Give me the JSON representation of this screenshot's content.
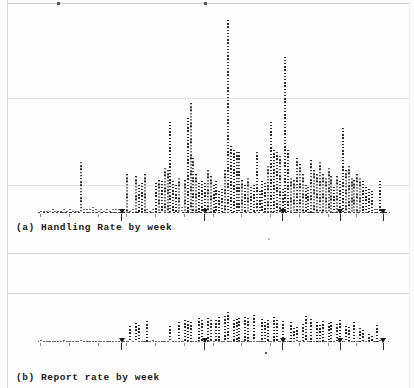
{
  "page": {
    "background_color": "#fdfdfd",
    "ink_color": "#2b2b2b",
    "rule_color": "#d5d5d5",
    "width": 414,
    "height": 388
  },
  "figures": [
    {
      "id": "figure-a",
      "caption": "(a) Handling Rate by week",
      "chart_data": {
        "type": "bar",
        "title": "(a) Handling Rate by week",
        "xlabel": "week",
        "ylabel": "Handling Rate",
        "grid": true,
        "legend": "none",
        "ylim": [
          0,
          100
        ],
        "axis_ticks_x": [
          28,
          57,
          84,
          104,
          119
        ],
        "categories": [
          "w1",
          "w2",
          "w3",
          "w4",
          "w5",
          "w6",
          "w7",
          "w8",
          "w9",
          "w10",
          "w11",
          "w12",
          "w13",
          "w14",
          "w15",
          "w16",
          "w17",
          "w18",
          "w19",
          "w20",
          "w21",
          "w22",
          "w23",
          "w24",
          "w25",
          "w26",
          "w27",
          "w28",
          "w29",
          "w30",
          "w31",
          "w32",
          "w33",
          "w34",
          "w35",
          "w36",
          "w37",
          "w38",
          "w39",
          "w40",
          "w41",
          "w42",
          "w43",
          "w44",
          "w45",
          "w46",
          "w47",
          "w48",
          "w49",
          "w50",
          "w51",
          "w52",
          "w53",
          "w54",
          "w55",
          "w56",
          "w57",
          "w58",
          "w59",
          "w60",
          "w61",
          "w62",
          "w63",
          "w64",
          "w65",
          "w66",
          "w67",
          "w68",
          "w69",
          "w70",
          "w71",
          "w72",
          "w73",
          "w74",
          "w75",
          "w76",
          "w77",
          "w78",
          "w79",
          "w80",
          "w81",
          "w82",
          "w83",
          "w84",
          "w85",
          "w86",
          "w87",
          "w88",
          "w89",
          "w90",
          "w91",
          "w92",
          "w93",
          "w94",
          "w95",
          "w96",
          "w97",
          "w98",
          "w99",
          "w100",
          "w101",
          "w102",
          "w103",
          "w104",
          "w105",
          "w106",
          "w107",
          "w108",
          "w109",
          "w110",
          "w111",
          "w112",
          "w113",
          "w114",
          "w115",
          "w116",
          "w117",
          "w118",
          "w119",
          "w120"
        ],
        "values": [
          1,
          1,
          1,
          1,
          2,
          1,
          1,
          1,
          2,
          1,
          2,
          1,
          1,
          1,
          26,
          2,
          2,
          2,
          3,
          2,
          1,
          2,
          1,
          2,
          1,
          2,
          2,
          2,
          1,
          2,
          20,
          1,
          2,
          19,
          14,
          15,
          20,
          2,
          1,
          2,
          15,
          17,
          16,
          23,
          22,
          46,
          16,
          14,
          18,
          3,
          17,
          48,
          56,
          28,
          20,
          15,
          16,
          15,
          22,
          19,
          14,
          16,
          11,
          12,
          22,
          98,
          34,
          32,
          31,
          31,
          17,
          14,
          18,
          13,
          14,
          31,
          11,
          16,
          15,
          24,
          46,
          32,
          31,
          29,
          12,
          79,
          32,
          18,
          17,
          28,
          25,
          20,
          14,
          13,
          27,
          22,
          20,
          26,
          20,
          18,
          23,
          19,
          13,
          19,
          16,
          43,
          22,
          24,
          18,
          17,
          20,
          18,
          16,
          13,
          12,
          11,
          2,
          2,
          16,
          2
        ]
      }
    },
    {
      "id": "figure-b",
      "caption": "(b) Report rate by week",
      "chart_data": {
        "type": "bar",
        "title": "(b) Report rate by week",
        "xlabel": "week",
        "ylabel": "Report rate",
        "grid": true,
        "legend": "none",
        "ylim": [
          0,
          40
        ],
        "axis_ticks_x": [
          28,
          57,
          84,
          104,
          119
        ],
        "categories": [
          "w1",
          "w2",
          "w3",
          "w4",
          "w5",
          "w6",
          "w7",
          "w8",
          "w9",
          "w10",
          "w11",
          "w12",
          "w13",
          "w14",
          "w15",
          "w16",
          "w17",
          "w18",
          "w19",
          "w20",
          "w21",
          "w22",
          "w23",
          "w24",
          "w25",
          "w26",
          "w27",
          "w28",
          "w29",
          "w30",
          "w31",
          "w32",
          "w33",
          "w34",
          "w35",
          "w36",
          "w37",
          "w38",
          "w39",
          "w40",
          "w41",
          "w42",
          "w43",
          "w44",
          "w45",
          "w46",
          "w47",
          "w48",
          "w49",
          "w50",
          "w51",
          "w52",
          "w53",
          "w54",
          "w55",
          "w56",
          "w57",
          "w58",
          "w59",
          "w60",
          "w61",
          "w62",
          "w63",
          "w64",
          "w65",
          "w66",
          "w67",
          "w68",
          "w69",
          "w70",
          "w71",
          "w72",
          "w73",
          "w74",
          "w75",
          "w76",
          "w77",
          "w78",
          "w79",
          "w80",
          "w81",
          "w82",
          "w83",
          "w84",
          "w85",
          "w86",
          "w87",
          "w88",
          "w89",
          "w90",
          "w91",
          "w92",
          "w93",
          "w94",
          "w95",
          "w96",
          "w97",
          "w98",
          "w99",
          "w100",
          "w101",
          "w102",
          "w103",
          "w104",
          "w105",
          "w106",
          "w107",
          "w108",
          "w109",
          "w110",
          "w111",
          "w112",
          "w113",
          "w114",
          "w115",
          "w116",
          "w117",
          "w118",
          "w119",
          "w120"
        ],
        "values": [
          2,
          1,
          1,
          1,
          1,
          1,
          1,
          1,
          2,
          1,
          1,
          1,
          1,
          1,
          2,
          1,
          1,
          1,
          1,
          1,
          1,
          1,
          1,
          1,
          1,
          1,
          1,
          1,
          3,
          1,
          1,
          16,
          1,
          19,
          17,
          1,
          1,
          21,
          1,
          2,
          1,
          1,
          1,
          1,
          1,
          16,
          1,
          1,
          20,
          1,
          22,
          21,
          20,
          1,
          1,
          24,
          22,
          1,
          24,
          22,
          1,
          22,
          25,
          1,
          26,
          30,
          1,
          22,
          23,
          24,
          1,
          25,
          24,
          1,
          27,
          1,
          1,
          23,
          20,
          22,
          1,
          25,
          22,
          1,
          21,
          1,
          1,
          20,
          14,
          15,
          1,
          18,
          26,
          1,
          23,
          1,
          20,
          17,
          21,
          1,
          19,
          20,
          1,
          18,
          22,
          1,
          16,
          15,
          1,
          20,
          1,
          14,
          12,
          1,
          8,
          6,
          1,
          17,
          2,
          1
        ]
      }
    }
  ]
}
